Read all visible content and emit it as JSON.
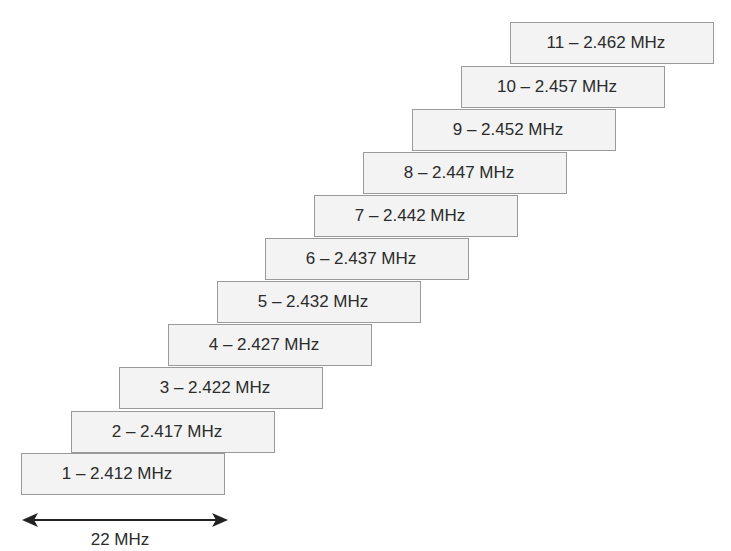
{
  "diagram": {
    "type": "staggered-channel-boxes",
    "channels": [
      {
        "number": 1,
        "label": "1 – 2.412 MHz",
        "x": 21,
        "y": 453
      },
      {
        "number": 2,
        "label": "2 – 2.417 MHz",
        "x": 71,
        "y": 411
      },
      {
        "number": 3,
        "label": "3 – 2.422 MHz",
        "x": 119,
        "y": 367
      },
      {
        "number": 4,
        "label": "4 – 2.427 MHz",
        "x": 168,
        "y": 324
      },
      {
        "number": 5,
        "label": "5 – 2.432 MHz",
        "x": 217,
        "y": 281
      },
      {
        "number": 6,
        "label": "6 – 2.437 MHz",
        "x": 265,
        "y": 238
      },
      {
        "number": 7,
        "label": "7 – 2.442 MHz",
        "x": 314,
        "y": 195
      },
      {
        "number": 8,
        "label": "8 – 2.447 MHz",
        "x": 363,
        "y": 152
      },
      {
        "number": 9,
        "label": "9 – 2.452 MHz",
        "x": 412,
        "y": 109
      },
      {
        "number": 10,
        "label": "10 – 2.457 MHz",
        "x": 461,
        "y": 66
      },
      {
        "number": 11,
        "label": "11 – 2.462 MHz",
        "x": 510,
        "y": 22
      }
    ],
    "width_indicator": {
      "label": "22 MHz",
      "arrow": "double-headed"
    },
    "colors": {
      "box_fill": "#f3f3f3",
      "box_border": "#9a9a9a",
      "text": "#2b2b2b",
      "arrow": "#222222"
    }
  }
}
